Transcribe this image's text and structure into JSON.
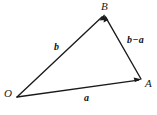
{
  "figure": {
    "type": "vector-triangle-diagram",
    "background_color": "#ffffff",
    "stroke_color": "#1a1a1a",
    "width": 157,
    "height": 115,
    "vertices": [
      {
        "name": "O",
        "label": "O",
        "x": 17,
        "y": 97
      },
      {
        "name": "B",
        "label": "B",
        "x": 104,
        "y": 15
      },
      {
        "name": "A",
        "label": "A",
        "x": 141,
        "y": 79
      }
    ],
    "vectors": [
      {
        "name": "b",
        "label": "b",
        "from": "O",
        "to": "B",
        "arrowhead_at": "B"
      },
      {
        "name": "a",
        "label": "a",
        "from": "O",
        "to": "A",
        "arrowhead_at": "A"
      },
      {
        "name": "b-a",
        "label": "b−a",
        "from": "A",
        "to": "B",
        "arrowhead_at": "B"
      }
    ]
  }
}
